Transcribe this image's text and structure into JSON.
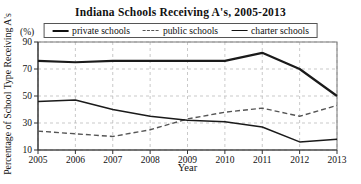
{
  "title": "Indiana Schools Receiving A's, 2005-2013",
  "legend": {
    "entries": [
      {
        "label": "private schools",
        "style": "solid-thick"
      },
      {
        "label": "public schools",
        "style": "dashed"
      },
      {
        "label": "charter schools",
        "style": "solid-thin"
      }
    ]
  },
  "axes": {
    "ylabel": "Percentage of School Type Receiving A's",
    "yunit": "(%)",
    "xlabel": "Year"
  },
  "colors": {
    "line_dark": "#1a1a1a",
    "line_dashed": "#555555",
    "grid": "#bbbbbb",
    "axis": "#333333",
    "box": "#777777",
    "text": "#111111"
  },
  "chart_data": {
    "type": "line",
    "title": "Indiana Schools Receiving A's, 2005-2013",
    "x": [
      2005,
      2006,
      2007,
      2008,
      2009,
      2010,
      2011,
      2012,
      2013
    ],
    "series": [
      {
        "name": "private schools",
        "line": "solid",
        "width": 2.2,
        "color": "#1a1a1a",
        "values": [
          76,
          75,
          76,
          76,
          76,
          76,
          82,
          70,
          50
        ]
      },
      {
        "name": "public schools",
        "line": "dashed",
        "width": 1.4,
        "color": "#555555",
        "values": [
          24,
          22,
          20,
          25,
          33,
          38,
          41,
          35,
          43
        ]
      },
      {
        "name": "charter schools",
        "line": "solid",
        "width": 1.5,
        "color": "#1a1a1a",
        "values": [
          46,
          47,
          40,
          35,
          32,
          31,
          27,
          16,
          18
        ]
      }
    ],
    "xlabel": "Year",
    "ylabel": "Percentage of School Type Receiving A's",
    "ylim": [
      10,
      90
    ],
    "yticks": [
      10,
      30,
      50,
      70,
      90
    ],
    "grid": true,
    "grid_style": "dashed",
    "legend_position": "top"
  }
}
